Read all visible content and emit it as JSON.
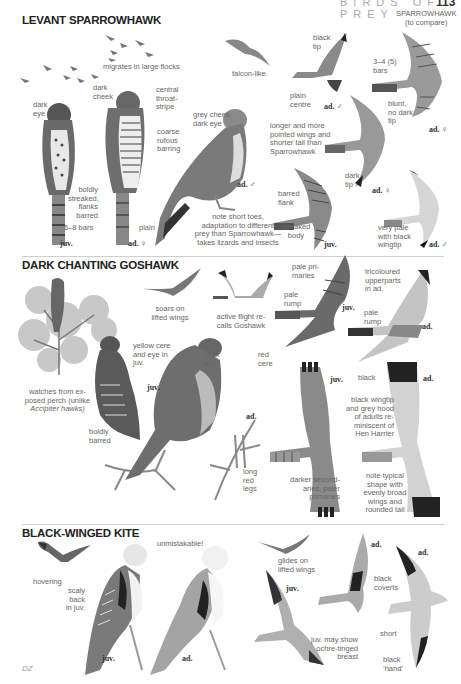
{
  "header": {
    "running_head": "BIRDS OF PREY",
    "page_number": "113"
  },
  "sections": [
    {
      "title": "LEVANT SPARROWHAWK",
      "labels": {
        "flocks": "migrates in large flocks",
        "falcon_like": "falcon-like",
        "sparrowhawk_compare": [
          "SPARROWHAWK",
          "(to compare)"
        ],
        "black_tip": [
          "black",
          "tip"
        ],
        "bars_3_4": [
          "3–4 (5)",
          "bars"
        ],
        "plain_centre": [
          "plain",
          "centre"
        ],
        "blunt": [
          "blunt,",
          "no dark",
          "tip"
        ],
        "dark_eye": [
          "dark",
          "eye"
        ],
        "dark_cheek": [
          "dark",
          "cheek"
        ],
        "central_stripe": [
          "central",
          "throat-",
          "stripe"
        ],
        "grey_cheek": [
          "grey cheek,",
          "dark eye"
        ],
        "coarse": [
          "coarse",
          "rufous",
          "barring"
        ],
        "longer": [
          "longer and more",
          "pointed wings and",
          "shorter tail than",
          "Sparrowhawk"
        ],
        "boldly_streaked": [
          "boldly",
          "streaked,",
          "flanks",
          "barred"
        ],
        "bars_6_8": "6–8 bars",
        "plain": "plain",
        "note_toes": [
          "note short toes,",
          "adaptation to different",
          "prey than Sparrowhawk—",
          "takes lizards and insects"
        ],
        "dark_tip": [
          "dark",
          "tip"
        ],
        "barred_flank": [
          "barred",
          "flank"
        ],
        "streaked_body": [
          "streaked",
          "body"
        ],
        "very_pale": [
          "very pale",
          "with black",
          "wingtip"
        ]
      },
      "tags": {
        "juv": "juv.",
        "ad_f": "ad. ♀",
        "ad_m": "ad. ♂",
        "flight_m": "ad. ♂",
        "compare_f": "ad. ♀",
        "flight_f": "ad. ♀",
        "flight_juv": "juv.",
        "flight_pale_m": "ad. ♂"
      }
    },
    {
      "title": "DARK CHANTING GOSHAWK",
      "labels": {
        "soars": [
          "soars on",
          "lifted wings"
        ],
        "active": [
          "active flight re-",
          "calls Goshawk"
        ],
        "pale_primaries": [
          "pale pri-",
          "maries"
        ],
        "pale_rump_juv": [
          "pale",
          "rump"
        ],
        "tricoloured": [
          "tricoloured",
          "upperparts",
          "in ad."
        ],
        "pale_rump_ad": [
          "pale",
          "rump"
        ],
        "yellow_cere": [
          "yellow cere",
          "and eye in",
          "juv."
        ],
        "dark_eye": [
          "dark",
          "eye"
        ],
        "red_cere": [
          "red",
          "cere"
        ],
        "watches": [
          "watches from ex-",
          "posed perch (unlike",
          "Accipiter hawks)"
        ],
        "boldly_barred": [
          "boldly",
          "barred"
        ],
        "long_red_legs": [
          "long",
          "red",
          "legs"
        ],
        "black": "black",
        "black_wingtip": [
          "black wingtip",
          "and grey hood",
          "of adults re-",
          "miniscent of",
          "Hen Harrier"
        ],
        "darker_secondaries": [
          "darker second-",
          "aries, paler",
          "primaries"
        ],
        "note_typical": [
          "note typical",
          "shape with",
          "evenly broad",
          "wings and",
          "rounded tail"
        ]
      },
      "tags": {
        "flight_juv": "juv.",
        "flight_ad": "ad.",
        "perched_juv": "juv.",
        "perched_ad": "ad.",
        "under_juv": "juv.",
        "under_ad": "ad."
      }
    },
    {
      "title": "BLACK-WINGED KITE",
      "labels": {
        "hovering": "hovering",
        "unmistakable": "unmistakable!",
        "scaly": [
          "scaly",
          "back",
          "in juv."
        ],
        "glides": [
          "glides on",
          "lifted wings"
        ],
        "black_coverts": [
          "black",
          "coverts"
        ],
        "short": "short",
        "ochre": [
          "juv. may show",
          "ochre-tinged",
          "breast"
        ],
        "black_hand": [
          "black",
          "‘hand’"
        ]
      },
      "tags": {
        "perched_juv": "juv.",
        "perched_ad": "ad.",
        "flight_juv": "juv.",
        "flight_ad1": "ad.",
        "flight_ad2": "ad."
      }
    }
  ],
  "footer": {
    "folio": "DZ"
  }
}
